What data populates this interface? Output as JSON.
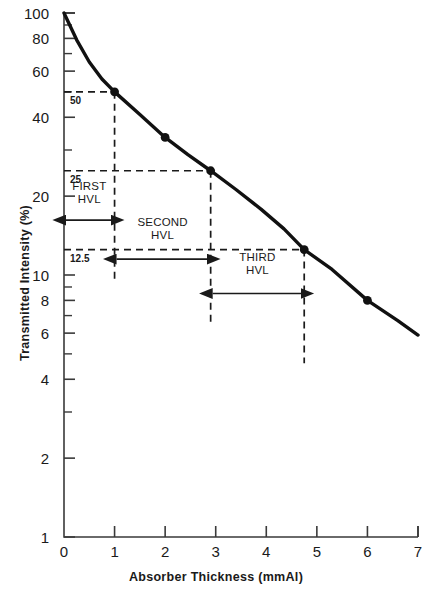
{
  "chart_data": {
    "type": "line",
    "title": "",
    "xlabel": "Absorber Thickness (mmAl)",
    "ylabel": "Transmitted Intensity (%)",
    "yscale": "log",
    "xscale": "linear",
    "xlim": [
      0,
      7
    ],
    "ylim": [
      1,
      100
    ],
    "grid": false,
    "legend": null,
    "xticks": [
      0,
      1,
      2,
      3,
      4,
      5,
      6,
      7
    ],
    "xtick_labels": [
      "0",
      "1",
      "2",
      "3",
      "4",
      "5",
      "6",
      "7"
    ],
    "yticks": [
      1,
      2,
      4,
      6,
      8,
      10,
      20,
      40,
      60,
      80,
      100
    ],
    "ytick_labels": [
      "1",
      "2",
      "4",
      "6",
      "8",
      "10",
      "20",
      "40",
      "60",
      "80",
      "100"
    ],
    "yticks_minor": [
      3,
      5,
      7,
      9,
      30,
      50,
      70,
      90
    ],
    "series": [
      {
        "name": "attenuation curve",
        "x": [
          0,
          0.25,
          0.5,
          0.75,
          1.0,
          1.5,
          2.0,
          2.45,
          2.9,
          3.4,
          3.9,
          4.35,
          4.75,
          5.3,
          6.0,
          6.6,
          7.0
        ],
        "y": [
          100,
          79,
          65,
          56,
          50,
          41,
          33.5,
          28.8,
          25,
          21.2,
          17.8,
          15.0,
          12.5,
          10.5,
          8.0,
          6.7,
          5.9
        ]
      }
    ],
    "markers": [
      {
        "x": 1.0,
        "y": 50
      },
      {
        "x": 2.0,
        "y": 33.5
      },
      {
        "x": 2.9,
        "y": 25
      },
      {
        "x": 4.75,
        "y": 12.5
      },
      {
        "x": 6.0,
        "y": 8.0
      }
    ],
    "level_labels": [
      {
        "text": "50",
        "y": 50,
        "x": 0.08
      },
      {
        "text": "25",
        "y": 25,
        "x": 0.08
      },
      {
        "text": "12.5",
        "y": 12.5,
        "x": 0.08
      }
    ],
    "guide_lines": [
      {
        "orientation": "horizontal",
        "y": 50,
        "from_x": 0,
        "to_x": 1.0
      },
      {
        "orientation": "vertical",
        "x": 1.0,
        "from_y": 50,
        "to_y": 9.3
      },
      {
        "orientation": "horizontal",
        "y": 25,
        "from_x": 0,
        "to_x": 2.9
      },
      {
        "orientation": "vertical",
        "x": 2.9,
        "from_y": 25,
        "to_y": 6.4
      },
      {
        "orientation": "horizontal",
        "y": 12.5,
        "from_x": 0,
        "to_x": 4.75
      },
      {
        "orientation": "vertical",
        "x": 4.75,
        "from_y": 12.5,
        "to_y": 4.6
      }
    ],
    "annotations": [
      {
        "label": "FIRST\nHVL",
        "line1": "FIRST",
        "line2": "HVL",
        "arrow_from_x": 0,
        "arrow_to_x": 1.0,
        "arrow_y": 16.2,
        "text_y": 20.5
      },
      {
        "label": "SECOND\nHVL",
        "line1": "SECOND",
        "line2": "HVL",
        "arrow_from_x": 1.0,
        "arrow_to_x": 2.9,
        "arrow_y": 11.5,
        "text_y": 15.0
      },
      {
        "label": "THIRD\nHVL",
        "line1": "THIRD",
        "line2": "HVL",
        "arrow_from_x": 2.9,
        "arrow_to_x": 4.75,
        "arrow_y": 8.5,
        "text_y": 11.0
      }
    ],
    "colors": {
      "curve": "#111111",
      "axis": "#3a3a3a",
      "dashed": "#1a1a1a",
      "background": "#ffffff"
    }
  }
}
